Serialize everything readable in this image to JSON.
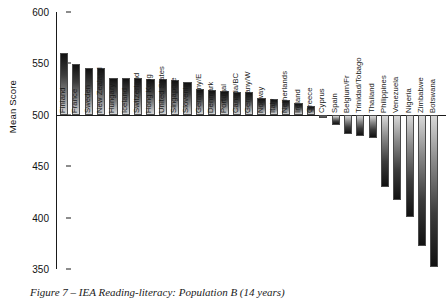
{
  "caption": "Figure 7 – IEA Reading-literacy: Population B (14 years)",
  "chart_data": {
    "type": "bar",
    "title": "",
    "xlabel": "",
    "ylabel": "Mean Score",
    "ylim": [
      350,
      600
    ],
    "yticks": [
      350,
      400,
      450,
      500,
      550,
      600
    ],
    "baseline": 500,
    "grid": false,
    "legend": null,
    "categories": [
      "Finland",
      "France",
      "Sweden",
      "New Zealand",
      "Hungary",
      "Iceland",
      "Switzerland",
      "Hong Kong",
      "United States",
      "Singapore",
      "Slovenia",
      "Germany/E",
      "Denmark",
      "Portugal",
      "Canada/BC",
      "Germany/W",
      "Norway",
      "Italy",
      "Netherlands",
      "Ireland",
      "Greece",
      "Cyprus",
      "Spain",
      "Belgium/Fr",
      "Trinidad/Tobago",
      "Thailand",
      "Philippines",
      "Venezuela",
      "Nigeria",
      "Zimbabwe",
      "Botswana"
    ],
    "values": [
      560,
      549,
      546,
      546,
      536,
      536,
      536,
      535,
      535,
      534,
      532,
      525,
      524,
      523,
      522,
      522,
      516,
      515,
      514,
      511,
      509,
      497,
      490,
      481,
      479,
      477,
      430,
      417,
      401,
      372,
      352
    ]
  }
}
